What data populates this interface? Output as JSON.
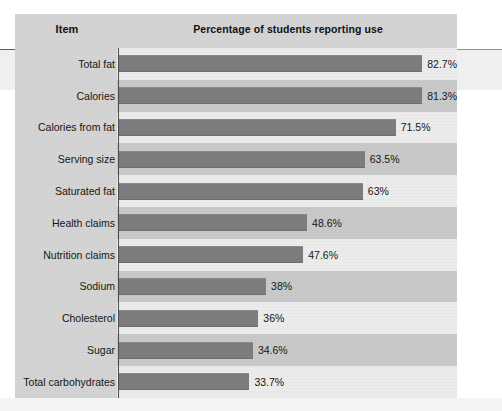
{
  "chart_data": {
    "type": "bar",
    "orientation": "horizontal",
    "title": "",
    "column_headers": {
      "category": "Item",
      "value": "Percentage of students reporting use"
    },
    "xlabel": "Percentage of students reporting use",
    "ylabel": "Item",
    "xlim": [
      0,
      100
    ],
    "grid": false,
    "legend": false,
    "bar_color": "#7d7d7d",
    "band_colors": [
      "#ececec",
      "#c9c9c9"
    ],
    "panel_color": "#d4d4d4",
    "categories": [
      "Total fat",
      "Calories",
      "Calories from fat",
      "Serving size",
      "Saturated fat",
      "Health claims",
      "Nutrition claims",
      "Sodium",
      "Cholesterol",
      "Sugar",
      "Total carbohydrates"
    ],
    "values": [
      82.7,
      81.3,
      71.5,
      63.5,
      63,
      48.6,
      47.6,
      38,
      36,
      34.6,
      33.7
    ],
    "value_labels": [
      "82.7%",
      "81.3%",
      "71.5%",
      "63.5%",
      "63%",
      "48.6%",
      "47.6%",
      "38%",
      "36%",
      "34.6%",
      "33.7%"
    ]
  },
  "rows": [
    {
      "label": "Total fat",
      "value": 82.7,
      "value_label": "82.7%"
    },
    {
      "label": "Calories",
      "value": 81.3,
      "value_label": "81.3%"
    },
    {
      "label": "Calories from fat",
      "value": 71.5,
      "value_label": "71.5%"
    },
    {
      "label": "Serving size",
      "value": 63.5,
      "value_label": "63.5%"
    },
    {
      "label": "Saturated fat",
      "value": 63,
      "value_label": "63%"
    },
    {
      "label": "Health claims",
      "value": 48.6,
      "value_label": "48.6%"
    },
    {
      "label": "Nutrition claims",
      "value": 47.6,
      "value_label": "47.6%"
    },
    {
      "label": "Sodium",
      "value": 38,
      "value_label": "38%"
    },
    {
      "label": "Cholesterol",
      "value": 36,
      "value_label": "36%"
    },
    {
      "label": "Sugar",
      "value": 34.6,
      "value_label": "34.6%"
    },
    {
      "label": "Total carbohydrates",
      "value": 33.7,
      "value_label": "33.7%"
    }
  ]
}
